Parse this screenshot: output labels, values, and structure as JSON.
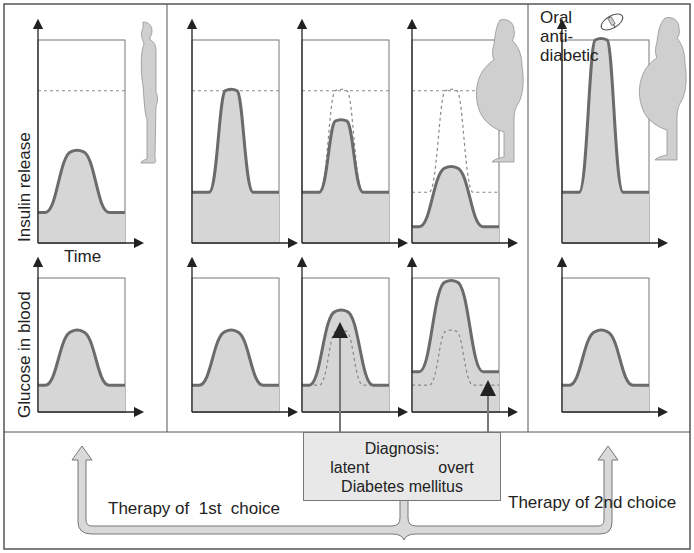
{
  "colors": {
    "frame": "#555555",
    "curve_stroke": "#6b6b6b",
    "curve_fill": "#d6d6d6",
    "dashed": "#888888",
    "arrow_band_fill": "#d9d9d9",
    "diagnosis_box_fill": "#e8e8e8",
    "silhouette_fill": "#cfcfcf"
  },
  "labels": {
    "y_axis_top": "Insulin release",
    "y_axis_bottom": "Glucose in blood",
    "x_axis": "Time",
    "oral_line1": "Oral",
    "oral_line2": "anti-",
    "oral_line3": "diabetic",
    "diagnosis_title": "Diagnosis:",
    "diagnosis_latent": "latent",
    "diagnosis_overt": "overt",
    "diagnosis_disease": "Diabetes mellitus",
    "therapy_1st": "Therapy of  1st  choice",
    "therapy_2nd": "Therapy of 2nd choice"
  },
  "icons": [
    "person-normal-icon",
    "person-obese-icon",
    "person-obese-2-icon",
    "pill-icon"
  ],
  "chart_data": [
    {
      "type": "area",
      "title": "Insulin release over time (5 stages)",
      "ylabel": "Insulin release",
      "xlabel": "Time",
      "panels": [
        {
          "stage": "normal weight",
          "baseline": 0.15,
          "peak": 0.45,
          "dashed_max": 0.75,
          "dashed_curve": null
        },
        {
          "stage": "obese, compensated",
          "baseline": 0.25,
          "peak": 0.75,
          "dashed_max": 0.75,
          "dashed_curve": null
        },
        {
          "stage": "latent diabetes",
          "baseline": 0.25,
          "peak": 0.6,
          "dashed_max": 0.75,
          "dashed_curve": {
            "baseline": 0.25,
            "peak": 0.75
          }
        },
        {
          "stage": "overt diabetes",
          "baseline": 0.08,
          "peak": 0.37,
          "dashed_max": 0.75,
          "dashed_curve": {
            "baseline": 0.25,
            "peak": 0.75
          }
        },
        {
          "stage": "oral antidiabetic",
          "baseline": 0.25,
          "peak": 1.0,
          "dashed_max": null,
          "dashed_curve": null
        }
      ]
    },
    {
      "type": "area",
      "title": "Glucose in blood over time (5 stages)",
      "ylabel": "Glucose in blood",
      "xlabel": "Time",
      "panels": [
        {
          "stage": "normal weight",
          "baseline": 0.2,
          "peak": 0.6,
          "dashed_curve": null
        },
        {
          "stage": "obese, compensated",
          "baseline": 0.2,
          "peak": 0.6,
          "dashed_curve": null
        },
        {
          "stage": "latent diabetes",
          "baseline": 0.2,
          "peak": 0.75,
          "dashed_curve": {
            "baseline": 0.2,
            "peak": 0.6
          }
        },
        {
          "stage": "overt diabetes",
          "baseline": 0.3,
          "peak": 0.97,
          "dashed_curve": {
            "baseline": 0.2,
            "peak": 0.6
          }
        },
        {
          "stage": "oral antidiabetic",
          "baseline": 0.2,
          "peak": 0.6,
          "dashed_curve": null
        }
      ]
    }
  ]
}
